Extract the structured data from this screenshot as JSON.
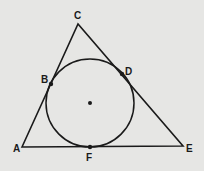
{
  "figure": {
    "background": "#e6e6e4",
    "stroke": "#1a1a1a",
    "triangle": {
      "A": [
        22,
        147
      ],
      "C": [
        78,
        24
      ],
      "E": [
        183,
        146
      ]
    },
    "circle": {
      "cx": 90,
      "cy": 103,
      "r": 44
    },
    "points": {
      "B": [
        51,
        84
      ],
      "D": [
        122,
        74
      ],
      "F": [
        90,
        147
      ],
      "center": [
        90,
        103
      ]
    },
    "labels": {
      "A": "A",
      "B": "B",
      "C": "C",
      "D": "D",
      "E": "E",
      "F": "F"
    }
  }
}
